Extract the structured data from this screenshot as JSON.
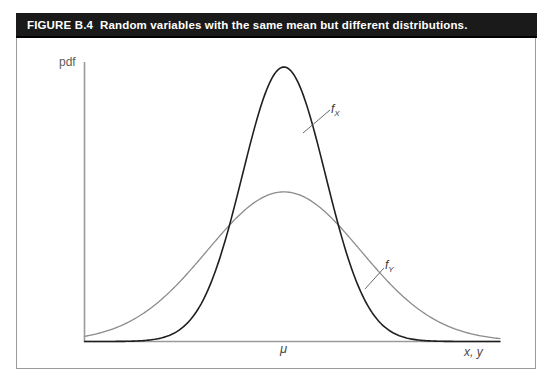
{
  "figure": {
    "number_label": "FIGURE B.4",
    "caption": "Random variables with the same mean but different distributions.",
    "title_background": "#1a1a1a",
    "title_color": "#ffffff"
  },
  "axes": {
    "y_label": "pdf",
    "x_label": "x, y",
    "x_tick_label": "μ",
    "axis_color": "#9a9a9a"
  },
  "annotations": {
    "curve_x_label_base": "f",
    "curve_x_label_sub": "X",
    "curve_y_label_base": "f",
    "curve_y_label_sub": "Y"
  },
  "chart_data": {
    "type": "line",
    "title": "Random variables with the same mean but different distributions.",
    "xlabel": "x, y",
    "ylabel": "pdf",
    "grid": false,
    "legend_position": "inline-annotations",
    "xlim": [
      -4.8,
      5.2
    ],
    "ylim": [
      0,
      1.05
    ],
    "xticks": [
      0
    ],
    "xticklabels": [
      "μ"
    ],
    "yticks": [],
    "yticklabels": [],
    "series": [
      {
        "name": "f_X",
        "label": "fX",
        "color": "#1f1f1f",
        "linewidth": 1.6,
        "distribution": "normal",
        "mean": 0,
        "sigma": 1.0,
        "peak_value": 1.0,
        "comment": "narrow, tall density: same mean, smaller variance",
        "x": [
          -4.8,
          -4.2,
          -3.6,
          -3.2,
          -2.8,
          -2.4,
          -2.0,
          -1.6,
          -1.2,
          -0.8,
          -0.4,
          0.0,
          0.4,
          0.8,
          1.2,
          1.6,
          2.0,
          2.4,
          2.8,
          3.2,
          3.6,
          4.2,
          4.8
        ],
        "y": [
          0.0,
          0.0,
          0.002,
          0.006,
          0.02,
          0.056,
          0.135,
          0.278,
          0.487,
          0.726,
          0.923,
          1.0,
          0.923,
          0.726,
          0.487,
          0.278,
          0.135,
          0.056,
          0.02,
          0.006,
          0.002,
          0.0,
          0.0
        ]
      },
      {
        "name": "f_Y",
        "label": "fY",
        "color": "#8c8c8c",
        "linewidth": 1.3,
        "distribution": "normal",
        "mean": 0,
        "sigma": 1.85,
        "peak_value": 0.545,
        "comment": "wide, flat density: same mean, larger variance",
        "x": [
          -4.8,
          -4.2,
          -3.6,
          -3.2,
          -2.8,
          -2.4,
          -2.0,
          -1.6,
          -1.2,
          -0.8,
          -0.4,
          0.0,
          0.4,
          0.8,
          1.2,
          1.6,
          2.0,
          2.4,
          2.8,
          3.2,
          3.6,
          4.2,
          4.8
        ],
        "y": [
          0.014,
          0.032,
          0.064,
          0.095,
          0.137,
          0.188,
          0.248,
          0.315,
          0.384,
          0.448,
          0.502,
          0.545,
          0.502,
          0.448,
          0.384,
          0.315,
          0.248,
          0.188,
          0.137,
          0.095,
          0.064,
          0.032,
          0.014
        ]
      }
    ],
    "annotations": [
      {
        "text": "fX",
        "target_series": "f_X",
        "at_x": 1.35,
        "leader": true
      },
      {
        "text": "fY",
        "target_series": "f_Y",
        "at_x": 3.0,
        "leader": true
      },
      {
        "text": "μ",
        "axis": "x",
        "at_x": 0.0
      }
    ]
  }
}
